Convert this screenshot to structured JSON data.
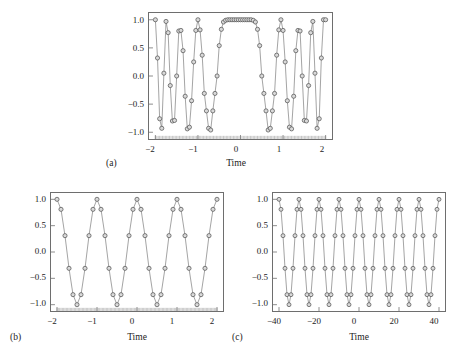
{
  "figure": {
    "background": "#ffffff",
    "line_color": "#7a7a7a",
    "marker_edge_color": "#4a4a4a",
    "marker_face_color": "#d9d9d9",
    "frame_color": "#6e6e6e",
    "text_color": "#1c1c1c"
  },
  "chart_data": [
    {
      "id": "panel-a",
      "type": "line",
      "caption": "(a)",
      "title": "",
      "xlabel": "Time",
      "ylabel": "",
      "xlim": [
        -2.15,
        2.15
      ],
      "ylim": [
        -1.12,
        1.12
      ],
      "xticks": [
        -2,
        -1,
        0,
        1,
        2
      ],
      "xticklabels": [
        "−2",
        "−1",
        "0",
        "1",
        "2"
      ],
      "yticks": [
        -1.0,
        -0.5,
        0.0,
        0.5,
        1.0
      ],
      "yticklabels": [
        "−1.0",
        "−0.5",
        "0.0",
        "0.5",
        "1.0"
      ],
      "grid": false,
      "legend": "none",
      "minor_ticks_bottom": true,
      "minor_tick_count": 120,
      "series": [
        {
          "name": "chirp-sampled",
          "marker": "circle-open",
          "sample_count": 81,
          "description": "Chirp signal cos(2*pi*f(t)*t) sampled at 81 points over t in [-2,2]; frequency increases with |t| producing a wide lobe near t=0 and rapid oscillation toward the edges.",
          "x": [
            -2.0,
            -1.95,
            -1.9,
            -1.85,
            -1.8,
            -1.75,
            -1.7,
            -1.65,
            -1.6,
            -1.55,
            -1.5,
            -1.45,
            -1.4,
            -1.35,
            -1.3,
            -1.25,
            -1.2,
            -1.15,
            -1.1,
            -1.05,
            -1.0,
            -0.95,
            -0.9,
            -0.85,
            -0.8,
            -0.75,
            -0.7,
            -0.65,
            -0.6,
            -0.55,
            -0.5,
            -0.45,
            -0.4,
            -0.35,
            -0.3,
            -0.25,
            -0.2,
            -0.15,
            -0.1,
            -0.05,
            0.0,
            0.05,
            0.1,
            0.15,
            0.2,
            0.25,
            0.3,
            0.35,
            0.4,
            0.45,
            0.5,
            0.55,
            0.6,
            0.65,
            0.7,
            0.75,
            0.8,
            0.85,
            0.9,
            0.95,
            1.0,
            1.05,
            1.1,
            1.15,
            1.2,
            1.25,
            1.3,
            1.35,
            1.4,
            1.45,
            1.5,
            1.55,
            1.6,
            1.65,
            1.7,
            1.75,
            1.8,
            1.85,
            1.9,
            1.95,
            2.0
          ],
          "y": [
            1.0,
            0.32,
            -0.76,
            -0.93,
            0.05,
            0.97,
            0.77,
            -0.17,
            -0.8,
            -0.79,
            0.0,
            0.8,
            0.81,
            0.45,
            -0.36,
            -0.94,
            -0.91,
            -0.44,
            0.25,
            0.81,
            1.0,
            0.82,
            0.37,
            -0.31,
            -0.62,
            -0.93,
            -0.96,
            -0.62,
            -0.31,
            0.0,
            0.54,
            0.83,
            0.96,
            0.99,
            1.0,
            1.0,
            1.0,
            1.0,
            1.0,
            1.0,
            1.0,
            1.0,
            1.0,
            1.0,
            1.0,
            1.0,
            0.99,
            0.96,
            0.83,
            0.54,
            0.0,
            -0.31,
            -0.62,
            -0.96,
            -0.93,
            -0.62,
            -0.31,
            0.37,
            0.82,
            1.0,
            0.81,
            0.25,
            -0.44,
            -0.91,
            -0.94,
            -0.36,
            0.45,
            0.81,
            0.8,
            0.0,
            -0.79,
            -0.8,
            -0.17,
            0.77,
            0.97,
            0.05,
            -0.93,
            -0.76,
            0.32,
            1.0,
            1.0
          ]
        }
      ]
    },
    {
      "id": "panel-b",
      "type": "line",
      "caption": "(b)",
      "title": "",
      "xlabel": "Time",
      "ylabel": "",
      "xlim": [
        -2.15,
        2.15
      ],
      "ylim": [
        -1.12,
        1.12
      ],
      "xticks": [
        -2,
        -1,
        0,
        1,
        2
      ],
      "xticklabels": [
        "−2",
        "−1",
        "0",
        "1",
        "2"
      ],
      "yticks": [
        -1.0,
        -0.5,
        0.0,
        0.5,
        1.0
      ],
      "yticklabels": [
        "−1.0",
        "−0.5",
        "0.0",
        "0.5",
        "1.0"
      ],
      "grid": false,
      "legend": "none",
      "minor_ticks_bottom": true,
      "minor_tick_count": 120,
      "series": [
        {
          "name": "chirp-undersampled",
          "marker": "circle-open",
          "sample_count": 41,
          "description": "Same chirp sampled coarsely (41 points) so samples land only on a small set of levels (±1.0, ±0.81, ±0.31) producing aliasing; the wide lobe near t=0 is preserved.",
          "x": [
            -2.0,
            -1.9,
            -1.8,
            -1.7,
            -1.6,
            -1.5,
            -1.4,
            -1.3,
            -1.2,
            -1.1,
            -1.0,
            -0.9,
            -0.8,
            -0.7,
            -0.6,
            -0.5,
            -0.4,
            -0.3,
            -0.2,
            -0.1,
            0.0,
            0.1,
            0.2,
            0.3,
            0.4,
            0.5,
            0.6,
            0.7,
            0.8,
            0.9,
            1.0,
            1.1,
            1.2,
            1.3,
            1.4,
            1.5,
            1.6,
            1.7,
            1.8,
            1.9,
            2.0
          ],
          "y": [
            1.0,
            0.81,
            0.31,
            -0.31,
            -0.81,
            -1.0,
            -0.81,
            -0.31,
            0.31,
            0.81,
            1.0,
            0.81,
            0.31,
            -0.31,
            -0.81,
            -1.0,
            -0.81,
            -0.31,
            0.31,
            0.81,
            1.0,
            0.81,
            0.31,
            -0.31,
            -0.81,
            -1.0,
            -0.81,
            -0.31,
            0.31,
            0.81,
            1.0,
            0.81,
            0.31,
            -0.31,
            -0.81,
            -1.0,
            -0.81,
            -0.31,
            0.31,
            0.81,
            1.0
          ]
        }
      ]
    },
    {
      "id": "panel-c",
      "type": "line",
      "caption": "(c)",
      "title": "",
      "xlabel": "Time",
      "ylabel": "",
      "xlim": [
        -43,
        43
      ],
      "ylim": [
        -1.12,
        1.12
      ],
      "xticks": [
        -40,
        -20,
        0,
        20,
        40
      ],
      "xticklabels": [
        "−40",
        "−20",
        "0",
        "20",
        "40"
      ],
      "yticks": [
        -1.0,
        -0.5,
        0.0,
        0.5,
        1.0
      ],
      "yticklabels": [
        "−1.0",
        "−0.5",
        "0.0",
        "0.5",
        "1.0"
      ],
      "grid": false,
      "legend": "none",
      "minor_ticks_bottom": false,
      "minor_tick_count": 0,
      "series": [
        {
          "name": "aliased-periodic",
          "marker": "circle-open",
          "sample_count": 80,
          "description": "Aliased reconstruction over an extended time axis [-40,40]: a uniform periodic waveform of period 10 with samples on levels 1.0, 0.81, 0.31, -0.31, -0.81, -1.0.",
          "period": 10,
          "levels": [
            1.0,
            0.81,
            0.31,
            -0.31,
            -0.81,
            -1.0
          ]
        }
      ]
    }
  ],
  "captions": {
    "a": "(a)",
    "b": "(b)",
    "c": "(c)"
  },
  "axis_titles": {
    "time": "Time"
  }
}
